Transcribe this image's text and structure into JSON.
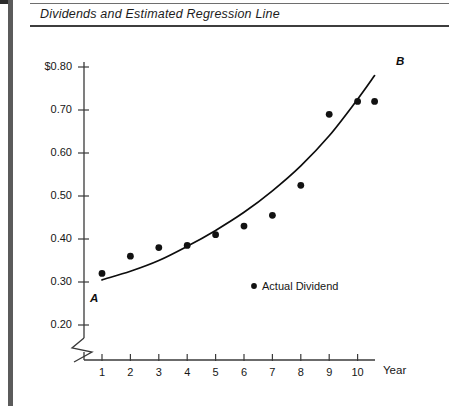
{
  "figure": {
    "title": "Dividends and Estimated Regression Line"
  },
  "legend": {
    "marker_icon": "filled-circle-icon",
    "label": "Actual Dividend"
  },
  "annotations": {
    "curve_start_label": "A",
    "curve_end_label": "B"
  },
  "colors": {
    "ink": "#0d0d0d",
    "axis": "#3a3a3a",
    "rule": "#5b5b5b",
    "marker": "#121212",
    "background": "#ffffff"
  },
  "chart_data": {
    "type": "scatter",
    "title": "Dividends and Estimated Regression Line",
    "xlabel": "Year",
    "ylabel": "",
    "x": [
      1,
      2,
      3,
      4,
      5,
      6,
      7,
      8,
      9,
      10,
      10.6
    ],
    "values": [
      0.32,
      0.36,
      0.38,
      0.385,
      0.41,
      0.43,
      0.455,
      0.525,
      0.69,
      0.72,
      0.72
    ],
    "series": [
      {
        "name": "Actual Dividend",
        "type": "scatter",
        "x": [
          1,
          2,
          3,
          4,
          5,
          6,
          7,
          8,
          9,
          10,
          10.6
        ],
        "values": [
          0.32,
          0.36,
          0.38,
          0.385,
          0.41,
          0.43,
          0.455,
          0.525,
          0.69,
          0.72,
          0.72
        ]
      },
      {
        "name": "Estimated Regression Line",
        "type": "line",
        "x": [
          1,
          2,
          3,
          4,
          5,
          6,
          7,
          8,
          9,
          10,
          10.6
        ],
        "values": [
          0.305,
          0.325,
          0.35,
          0.383,
          0.42,
          0.462,
          0.512,
          0.57,
          0.64,
          0.725,
          0.78
        ]
      }
    ],
    "xticks": [
      1,
      2,
      3,
      4,
      5,
      6,
      7,
      8,
      9,
      10
    ],
    "xticklabels": [
      "1",
      "2",
      "3",
      "4",
      "5",
      "6",
      "7",
      "8",
      "9",
      "10"
    ],
    "yticks": [
      0.2,
      0.3,
      0.4,
      0.5,
      0.6,
      0.7,
      0.8
    ],
    "yticklabels": [
      "0.20",
      "0.30",
      "0.40",
      "0.50",
      "0.60",
      "0.70",
      "$0.80"
    ],
    "xlim": [
      0.5,
      11.2
    ],
    "ylim": [
      0.2,
      0.82
    ],
    "grid": false,
    "legend_position": "inside-center",
    "axis_break": true,
    "annotations": [
      "A",
      "B"
    ]
  }
}
